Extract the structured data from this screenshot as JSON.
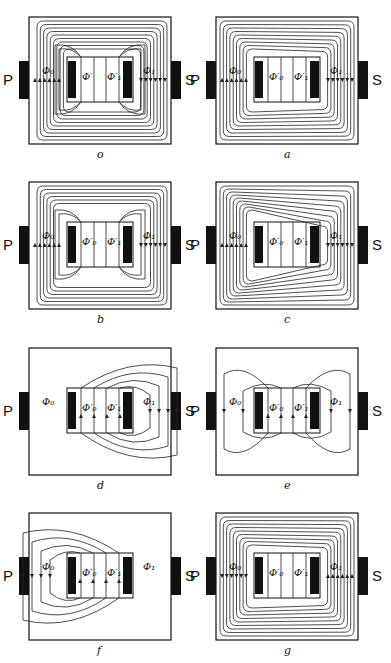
{
  "figure": {
    "coil_labels": {
      "primary": "P",
      "secondary": "S"
    },
    "panels": [
      {
        "id": "o",
        "caption": "o",
        "outer_lines": 9,
        "inner_lines": 2,
        "pattern": "symmetric",
        "labels": {
          "phi0": "Φ₀",
          "phi0p": "Φ′",
          "phi1p": "Φ′₁",
          "phi1": "Φ₁"
        }
      },
      {
        "id": "a",
        "caption": "a",
        "outer_lines": 9,
        "inner_lines": 2,
        "pattern": "skew-left",
        "labels": {
          "phi0": "Φ₀",
          "phi0p": "Φ′₀",
          "phi1p": "Φ′₁",
          "phi1": "Φ₁"
        }
      },
      {
        "id": "b",
        "caption": "b",
        "outer_lines": 6,
        "inner_lines": 2,
        "pattern": "symmetric",
        "labels": {
          "phi0": "Φ₀",
          "phi0p": "Φ′₀",
          "phi1p": "Φ′₁",
          "phi1": "Φ₁"
        }
      },
      {
        "id": "c",
        "caption": "c",
        "outer_lines": 9,
        "inner_lines": 2,
        "pattern": "skew-right",
        "labels": {
          "phi0": "Φ₀",
          "phi0p": "Φ′₀",
          "phi1p": "Φ′₁",
          "phi1": "Φ₁"
        }
      },
      {
        "id": "d",
        "caption": "d",
        "outer_lines": 4,
        "inner_lines": 0,
        "pattern": "right-loops",
        "labels": {
          "phi0": "Φ₀",
          "phi0p": "Φ′₀",
          "phi1p": "Φ′₁",
          "phi1": "Φ₁"
        }
      },
      {
        "id": "e",
        "caption": "e",
        "outer_lines": 2,
        "inner_lines": 0,
        "pattern": "both-loops",
        "labels": {
          "phi0": "Φ₀",
          "phi0p": "Φ′₀",
          "phi1p": "Φ′₁",
          "phi1": "Φ₁"
        }
      },
      {
        "id": "f",
        "caption": "f",
        "outer_lines": 4,
        "inner_lines": 0,
        "pattern": "left-loops",
        "labels": {
          "phi0": "Φ₀",
          "phi0p": "Φ′₀",
          "phi1p": "Φ′₁",
          "phi1": "Φ₁"
        }
      },
      {
        "id": "g",
        "caption": "g",
        "outer_lines": 9,
        "inner_lines": 2,
        "pattern": "skew-left",
        "labels": {
          "phi0": "Φ₀",
          "phi0p": "Φ′₀",
          "phi1p": "Φ′₁",
          "phi1": "Φ₁"
        }
      }
    ]
  }
}
